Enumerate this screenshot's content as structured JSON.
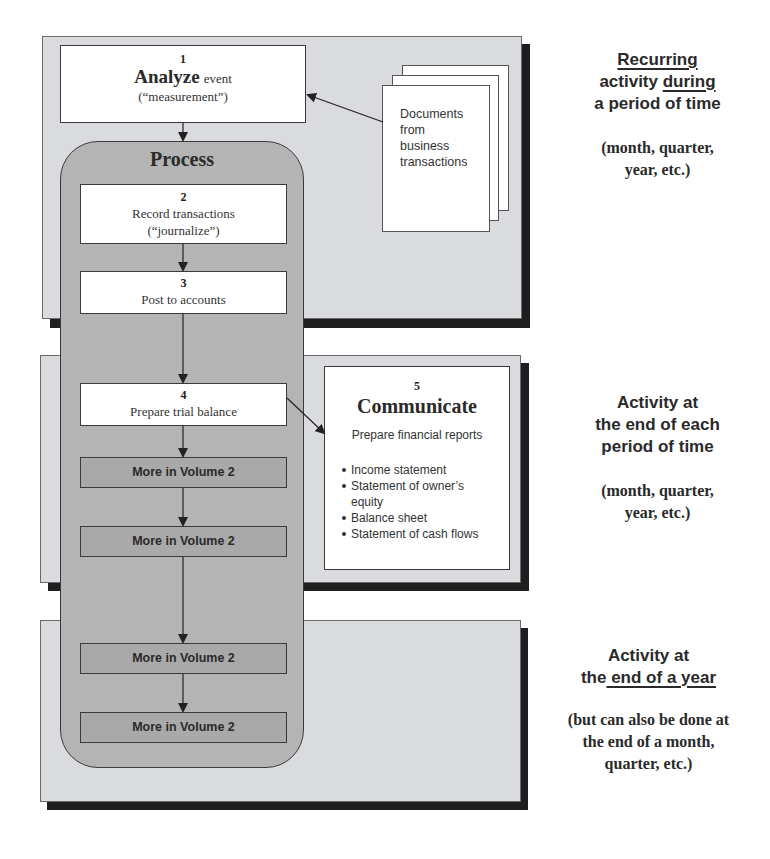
{
  "diagram": {
    "type": "accounting-cycle-flowchart",
    "steps": [
      {
        "number": "1",
        "title": "Analyze",
        "title_suffix": "event",
        "subtitle": "(“measurement”)"
      },
      {
        "number": "2",
        "title": "Record transactions",
        "subtitle": "(“journalize”)"
      },
      {
        "number": "3",
        "title": "Post to accounts"
      },
      {
        "number": "4",
        "title": "Prepare trial balance"
      },
      {
        "number": "5",
        "title": "Communicate",
        "subtitle": "Prepare financial reports",
        "items": [
          "Income statement",
          "Statement of owner’s equity",
          "Balance sheet",
          "Statement of cash flows"
        ]
      }
    ],
    "process_label": "Process",
    "documents_label": [
      "Documents",
      "from",
      "business",
      "transactions"
    ],
    "more_boxes": [
      "More in Volume 2",
      "More in Volume 2",
      "More in Volume 2",
      "More in Volume 2"
    ],
    "side_notes": [
      {
        "heading_parts": [
          {
            "text": "Recurring",
            "underline": true
          },
          {
            "text": "activity ",
            "underline": false
          },
          {
            "text": "during",
            "underline": true
          },
          {
            "text": "a period of time",
            "underline": false
          }
        ],
        "subtext": [
          "(month, quarter,",
          "year, etc.)"
        ]
      },
      {
        "heading": [
          "Activity at",
          "the end of each",
          "period of time"
        ],
        "subtext": [
          "(month, quarter,",
          "year, etc.)"
        ]
      },
      {
        "heading_parts": [
          {
            "text": "Activity at",
            "underline": false
          },
          {
            "text": "the",
            "underline": false
          },
          {
            "text": " end of a year",
            "underline": true
          }
        ],
        "subtext": [
          "(but can also be done at",
          "the end of a month,",
          "quarter, etc.)"
        ]
      }
    ],
    "colors": {
      "panel_bg": "#d9dbde",
      "panel_shadow": "#1e1e1e",
      "process_bg": "#b4b4b4",
      "more_box_bg": "#a9a9a9",
      "box_bg": "#ffffff",
      "text": "#2a2a2a"
    }
  }
}
